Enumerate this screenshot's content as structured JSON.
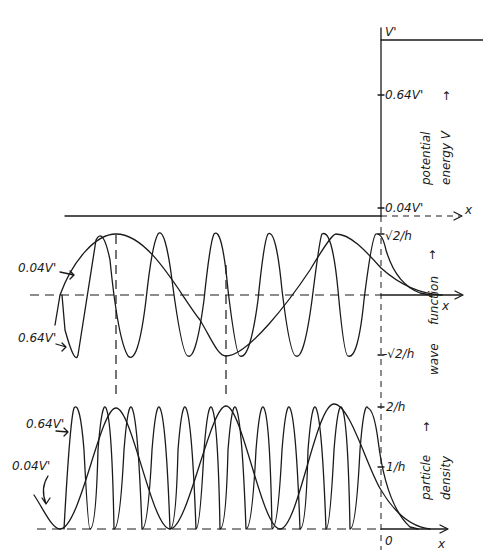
{
  "potential_panel": {
    "top_label": "V'",
    "mid_label": "0.64V'",
    "bottom_label": "0.04V'",
    "axis_x_label": "x",
    "axis_title_line1": "potential",
    "axis_title_line2": "energy V",
    "arrow": "→"
  },
  "wave_panel": {
    "curve_label_low": "0.04V'",
    "curve_label_high": "0.64V'",
    "tick_top": "√2/h",
    "tick_bottom": "-√2/h",
    "axis_x_label": "x",
    "axis_title_line1": "function",
    "axis_title_line2": "wave",
    "arrow": "→"
  },
  "density_panel": {
    "curve_label_high": "0.64V'",
    "curve_label_low": "0.04V'",
    "tick_top": "2/h",
    "tick_mid": "1/h",
    "origin_label": "0",
    "axis_x_label": "x",
    "axis_title_line1": "particle",
    "axis_title_line2": "density",
    "arrow": "→"
  },
  "colors": {
    "ink": "#1a1a1a",
    "paper": "#ffffff"
  }
}
